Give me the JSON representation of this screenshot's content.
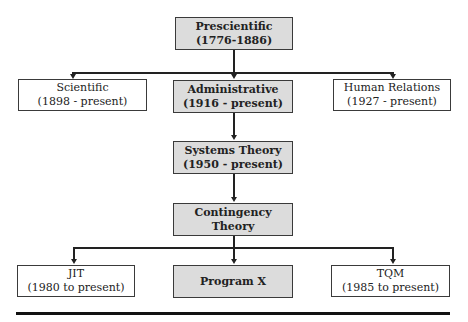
{
  "diagram": {
    "nodes": {
      "prescientific": {
        "title": "Prescientific",
        "subtitle": "(1776-1886)",
        "style": "shaded"
      },
      "scientific": {
        "title": "Scientific",
        "subtitle": "(1898 - present)",
        "style": "plain"
      },
      "administrative": {
        "title": "Administrative",
        "subtitle": "(1916 - present)",
        "style": "shaded"
      },
      "human_relations": {
        "title": "Human Relations",
        "subtitle": "(1927 - present)",
        "style": "plain"
      },
      "systems_theory": {
        "title": "Systems Theory",
        "subtitle": "(1950 - present)",
        "style": "shaded"
      },
      "contingency_theory": {
        "title": "Contingency",
        "subtitle": "Theory",
        "style": "shaded"
      },
      "jit": {
        "title": "JIT",
        "subtitle": "(1980 to present)",
        "style": "plain"
      },
      "program_x": {
        "title": "Program X",
        "style": "shaded"
      },
      "tqm": {
        "title": "TQM",
        "subtitle": "(1985 to present)",
        "style": "plain"
      }
    },
    "edges": [
      [
        "prescientific",
        "scientific"
      ],
      [
        "prescientific",
        "administrative"
      ],
      [
        "prescientific",
        "human_relations"
      ],
      [
        "administrative",
        "systems_theory"
      ],
      [
        "systems_theory",
        "contingency_theory"
      ],
      [
        "contingency_theory",
        "jit"
      ],
      [
        "contingency_theory",
        "program_x"
      ],
      [
        "contingency_theory",
        "tqm"
      ]
    ],
    "colors": {
      "shaded_fill": "#dcdcdc",
      "border": "#3a3a3a",
      "line": "#222222"
    }
  }
}
